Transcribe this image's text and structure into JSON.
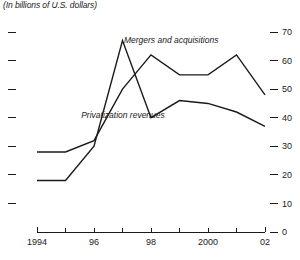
{
  "subtitle": "(In billions of U.S. dollars)",
  "chart_data": {
    "type": "line",
    "title": "",
    "subtitle": "(In billions of U.S. dollars)",
    "xlabel": "",
    "ylabel": "",
    "x": [
      1994,
      1995,
      1996,
      1997,
      1998,
      1999,
      2000,
      2001,
      2002
    ],
    "xtick_values": [
      1994,
      1995,
      1996,
      1997,
      1998,
      1999,
      2000,
      2001,
      2002
    ],
    "xtick_labels": [
      "1994",
      "",
      "96",
      "",
      "98",
      "",
      "2000",
      "",
      "02"
    ],
    "xlim": [
      1994,
      2002
    ],
    "ytick_values": [
      0,
      10,
      20,
      30,
      40,
      50,
      60,
      70
    ],
    "ytick_labels": [
      "0",
      "10",
      "20",
      "30",
      "40",
      "50",
      "60",
      "70"
    ],
    "ylim": [
      0,
      70
    ],
    "grid": false,
    "legend_position": "inline-annotations",
    "y_axis_side": "right",
    "left_axis_ticks_unlabeled": true,
    "series": [
      {
        "name": "Mergers and acquisitions",
        "label_x": 1997.05,
        "label_y": 66.0,
        "values": [
          28,
          28,
          32,
          50,
          62,
          55,
          55,
          62,
          48
        ]
      },
      {
        "name": "Privatization revenues",
        "label_x": 1995.55,
        "label_y": 40.0,
        "values": [
          18,
          18,
          30,
          67,
          40,
          46,
          45,
          42,
          37
        ]
      }
    ]
  },
  "colors": {
    "line": "#1a1a1a",
    "axis": "#1a1a1a",
    "text": "#1a1a1a",
    "background": "#ffffff"
  }
}
